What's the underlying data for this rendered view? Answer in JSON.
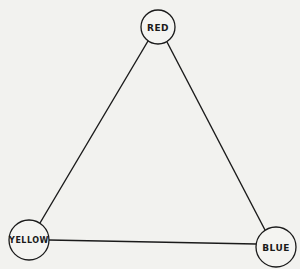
{
  "diagram": {
    "type": "triangle-graph",
    "colors": {
      "background": "#f2f2ef",
      "stroke": "#1a1a1a"
    },
    "nodes": [
      {
        "id": "red",
        "label": "RED",
        "cx": 158,
        "cy": 27,
        "r": 17,
        "font_size": 9
      },
      {
        "id": "yellow",
        "label": "YELLOW",
        "cx": 29,
        "cy": 240,
        "r": 20,
        "font_size": 8
      },
      {
        "id": "blue",
        "label": "BLUE",
        "cx": 276,
        "cy": 247,
        "r": 20,
        "font_size": 9
      }
    ],
    "edges": [
      {
        "from": "red",
        "to": "yellow"
      },
      {
        "from": "red",
        "to": "blue"
      },
      {
        "from": "yellow",
        "to": "blue"
      }
    ]
  }
}
